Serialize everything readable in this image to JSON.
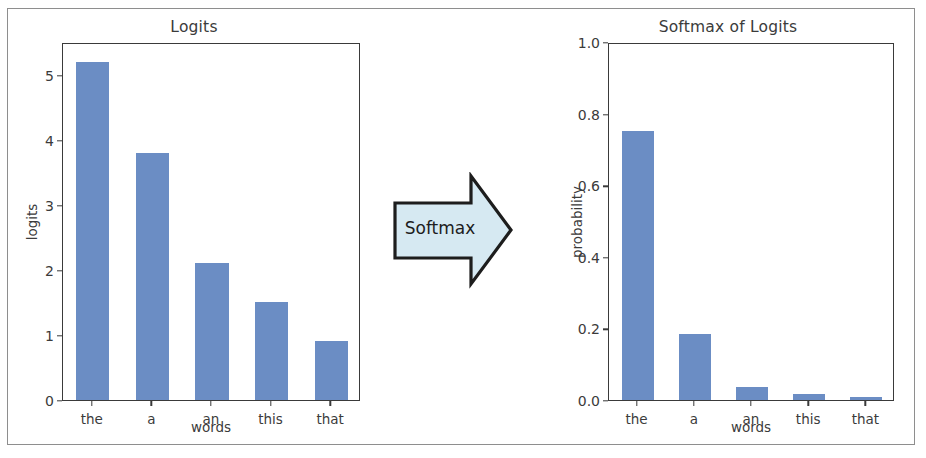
{
  "figure": {
    "border_color": "#8e8e8e",
    "background": "#ffffff",
    "bar_color": "#6b8dc4",
    "arrow_fill": "#d6e9f2",
    "arrow_stroke": "#1d1d1d"
  },
  "arrow": {
    "label": "Softmax",
    "direction": "right"
  },
  "chart_data": [
    {
      "type": "bar",
      "title": "Logits",
      "xlabel": "words",
      "ylabel": "logits",
      "categories": [
        "the",
        "a",
        "an",
        "this",
        "that"
      ],
      "values": [
        5.2,
        3.8,
        2.1,
        1.5,
        0.9
      ],
      "ylim": [
        0,
        5.5
      ],
      "yticks": [
        "0",
        "1",
        "2",
        "3",
        "4",
        "5"
      ],
      "ytick_values": [
        0,
        1,
        2,
        3,
        4,
        5
      ],
      "grid": false,
      "legend": null,
      "bar_color": "#6b8dc4"
    },
    {
      "type": "bar",
      "title": "Softmax of Logits",
      "xlabel": "words",
      "ylabel": "probability",
      "categories": [
        "the",
        "a",
        "an",
        "this",
        "that"
      ],
      "values": [
        0.752,
        0.185,
        0.037,
        0.017,
        0.0075
      ],
      "ylim": [
        0,
        1.0
      ],
      "yticks": [
        "0.0",
        "0.2",
        "0.4",
        "0.6",
        "0.8",
        "1.0"
      ],
      "ytick_values": [
        0.0,
        0.2,
        0.4,
        0.6,
        0.8,
        1.0
      ],
      "grid": false,
      "legend": null,
      "bar_color": "#6b8dc4"
    }
  ]
}
